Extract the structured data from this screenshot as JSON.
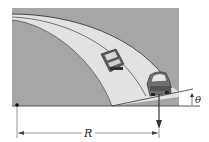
{
  "diagram": {
    "type": "banked-curve-physics",
    "labels": {
      "radius": "R",
      "angle": "θ"
    },
    "elements": [
      {
        "name": "banked-road",
        "description": "curved banked road lane"
      },
      {
        "name": "car-upper",
        "description": "car driving on inner lane of banked curve"
      },
      {
        "name": "car-lower",
        "description": "car driving on outer lane, viewed from front"
      },
      {
        "name": "center-point",
        "description": "center of curvature marker"
      },
      {
        "name": "weight-arrow",
        "description": "downward vertical arrow from car"
      },
      {
        "name": "radius-dimension",
        "description": "horizontal dimension line labeled R"
      },
      {
        "name": "bank-angle",
        "description": "angle θ between banked surface and horizontal"
      }
    ],
    "colors": {
      "background_box": "#a6a6a6",
      "road_surface": "#e4e4e4",
      "lines": "#333333",
      "car_body": "#6f6f6f"
    }
  }
}
